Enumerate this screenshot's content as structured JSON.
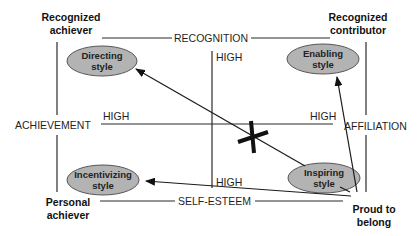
{
  "diagram": {
    "corners": {
      "top_left": {
        "line1": "Recognized",
        "line2": "achiever"
      },
      "top_right": {
        "line1": "Recognized",
        "line2": "contributor"
      },
      "bottom_left": {
        "line1": "Personal",
        "line2": "achiever"
      },
      "bottom_right": {
        "line1": "Proud to",
        "line2": "belong"
      }
    },
    "axes": {
      "top": "RECOGNITION",
      "bottom": "SELF-ESTEEM",
      "left": "ACHIEVEMENT",
      "right": "AFFILIATION"
    },
    "high_labels": {
      "center_top": "HIGH",
      "center_bottom": "HIGH",
      "left_mid": "HIGH",
      "right_mid": "HIGH"
    },
    "styles": {
      "directing": {
        "line1": "Directing",
        "line2": "style"
      },
      "enabling": {
        "line1": "Enabling",
        "line2": "style"
      },
      "incentivizing": {
        "line1": "Incentivizing",
        "line2": "style"
      },
      "inspiring": {
        "line1": "Inspiring",
        "line2": "style"
      }
    },
    "colors": {
      "ellipse_fill": "#b3b3b3",
      "ellipse_stroke": "#555555",
      "line": "#2a2a2a",
      "cross": "#111111"
    },
    "arrows": [
      {
        "from": "inspiring",
        "to": "directing",
        "blocked": true
      },
      {
        "from": "proud-to-belong",
        "to": "enabling",
        "blocked": false
      },
      {
        "from": "proud-to-belong",
        "to": "incentivizing",
        "blocked": false
      }
    ]
  }
}
